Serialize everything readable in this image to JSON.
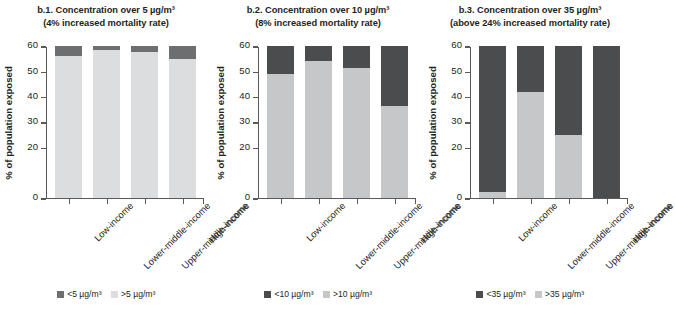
{
  "figure": {
    "ylabel": "% of population exposed",
    "categories": [
      "Low-income",
      "Lower-middle-income",
      "Upper-middle-income",
      "High-income"
    ],
    "yticks": [
      "0",
      "20",
      "30",
      "40",
      "50",
      "60"
    ],
    "ylim": [
      0,
      60
    ],
    "colors": {
      "b1_dark": "#6d6e70",
      "b1_light": "#dcdddf",
      "dark": "#4b4c4e",
      "light": "#c6c7c9",
      "axis": "#58595b",
      "text": "#231f20",
      "background": "#ffffff"
    }
  },
  "chart_data": [
    {
      "type": "bar",
      "id": "b.1",
      "title": "b.1. Concentration over 5 µg/m³",
      "subtitle": "(4% increased mortality rate)",
      "xlabel": "",
      "ylabel": "% of population exposed",
      "ylim": [
        0,
        60
      ],
      "yticks": [
        0,
        20,
        30,
        40,
        50,
        60
      ],
      "grid": false,
      "stacked": true,
      "legend_position": "bottom",
      "categories": [
        "Low-income",
        "Lower-middle-income",
        "Upper-middle-income",
        "High-income"
      ],
      "series": [
        {
          "name": "<5 µg/m³",
          "color": "#6d6e70",
          "values": [
            4.0,
            1.5,
            2.5,
            5.0
          ]
        },
        {
          "name": ">5 µg/m³",
          "color": "#dcdddf",
          "values": [
            56.0,
            58.5,
            57.5,
            55.0
          ]
        }
      ],
      "legend": [
        "<5 µg/m³",
        ">5 µg/m³"
      ]
    },
    {
      "type": "bar",
      "id": "b.2",
      "title": "b.2. Concentration over 10 µg/m³",
      "subtitle": "(8% increased mortality rate)",
      "xlabel": "",
      "ylabel": "% of population exposed",
      "ylim": [
        0,
        60
      ],
      "yticks": [
        0,
        20,
        30,
        40,
        50,
        60
      ],
      "grid": false,
      "stacked": true,
      "legend_position": "bottom",
      "categories": [
        "Low-income",
        "Lower-middle-income",
        "Upper-middle-income",
        "High-income"
      ],
      "series": [
        {
          "name": "<10 µg/m³",
          "color": "#4b4c4e",
          "values": [
            11.0,
            6.0,
            8.5,
            23.5
          ]
        },
        {
          "name": ">10 µg/m³",
          "color": "#c6c7c9",
          "values": [
            49.0,
            54.0,
            51.5,
            36.5
          ]
        }
      ],
      "legend": [
        "<10 µg/m³",
        ">10 µg/m³"
      ]
    },
    {
      "type": "bar",
      "id": "b.3",
      "title": "b.3. Concentration over 35 µg/m³",
      "subtitle": "(above 24% increased mortality rate)",
      "xlabel": "",
      "ylabel": "% of population exposed",
      "ylim": [
        0,
        60
      ],
      "yticks": [
        0,
        20,
        30,
        40,
        50,
        60
      ],
      "grid": false,
      "stacked": true,
      "legend_position": "bottom",
      "categories": [
        "Low-income",
        "Lower-middle-income",
        "Upper-middle-income",
        "High-income"
      ],
      "series": [
        {
          "name": "<35 µg/m³",
          "color": "#4b4c4e",
          "values": [
            57.5,
            18.0,
            35.0,
            60.0
          ]
        },
        {
          "name": ">35 µg/m³",
          "color": "#c6c7c9",
          "values": [
            2.5,
            42.0,
            25.0,
            0.0
          ]
        }
      ],
      "legend": [
        "<35 µg/m³",
        ">35 µg/m³"
      ]
    }
  ]
}
